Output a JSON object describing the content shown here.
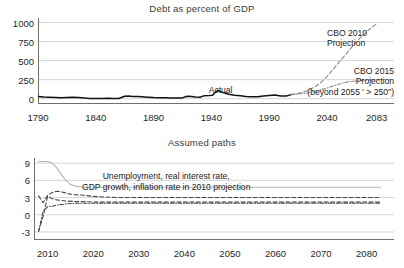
{
  "figure": {
    "background_color": "#ffffff",
    "axis_color": "#6f6f6f",
    "grid_color": "#c9c9c9",
    "actual_color": "#111111",
    "projection_color": "#8a8a8a",
    "unemployment_color": "#b5b5b5"
  },
  "chart_data": [
    {
      "type": "line",
      "title": "Debt as percent of GDP",
      "xlabel": "",
      "ylabel": "",
      "xlim": [
        1790,
        2098
      ],
      "ylim": [
        -70,
        1060
      ],
      "grid": true,
      "legend_position": "inline-annotations",
      "xticks": [
        1790,
        1840,
        1890,
        1940,
        1990,
        2040,
        2083
      ],
      "yticks": [
        0,
        250,
        500,
        750,
        1000
      ],
      "annotations": [
        {
          "name": "actual",
          "text": "Actual",
          "x": 1948,
          "y": 185
        },
        {
          "name": "cbo-2010",
          "text_lines": [
            "CBO 2010",
            "Projection"
          ],
          "x": 2040,
          "y": 930
        },
        {
          "name": "cbo-2015",
          "text_lines": [
            "CBO 2015",
            "Projection",
            "(beyond 2055 ' > 250\")"
          ],
          "x": 2072,
          "y": 430
        }
      ],
      "series": [
        {
          "name": "Actual",
          "style": "solid",
          "color": "#111111",
          "x": [
            1790,
            1795,
            1800,
            1805,
            1810,
            1815,
            1820,
            1825,
            1830,
            1835,
            1840,
            1845,
            1850,
            1855,
            1860,
            1865,
            1868,
            1872,
            1876,
            1880,
            1885,
            1890,
            1895,
            1900,
            1905,
            1910,
            1915,
            1918,
            1920,
            1923,
            1926,
            1930,
            1934,
            1938,
            1941,
            1944,
            1946,
            1950,
            1955,
            1960,
            1965,
            1970,
            1974,
            1980,
            1985,
            1990,
            1995,
            2000,
            2005,
            2009
          ],
          "y": [
            30,
            22,
            18,
            15,
            12,
            15,
            19,
            14,
            8,
            2,
            1,
            3,
            4,
            3,
            2,
            32,
            34,
            30,
            27,
            24,
            20,
            15,
            13,
            11,
            10,
            9,
            10,
            28,
            32,
            27,
            22,
            19,
            40,
            42,
            45,
            95,
            108,
            80,
            57,
            45,
            38,
            28,
            24,
            26,
            36,
            42,
            49,
            35,
            36,
            53
          ]
        },
        {
          "name": "CBO 2010 Projection",
          "style": "dashed",
          "color": "#8a8a8a",
          "x": [
            2009,
            2015,
            2020,
            2025,
            2030,
            2035,
            2040,
            2045,
            2050,
            2055,
            2060,
            2065,
            2070,
            2075,
            2080,
            2083
          ],
          "y": [
            53,
            70,
            90,
            120,
            160,
            215,
            290,
            380,
            470,
            560,
            650,
            740,
            820,
            890,
            950,
            985
          ]
        },
        {
          "name": "CBO 2015 Projection",
          "style": "dash-dot",
          "color": "#8a8a8a",
          "x": [
            2009,
            2015,
            2020,
            2025,
            2030,
            2035,
            2040,
            2045,
            2050,
            2055,
            2060,
            2070,
            2080,
            2090
          ],
          "y": [
            53,
            60,
            70,
            82,
            98,
            118,
            140,
            165,
            190,
            210,
            225,
            240,
            248,
            252
          ]
        }
      ]
    },
    {
      "type": "line",
      "title": "Assumed paths",
      "xlabel": "",
      "ylabel": "",
      "xlim": [
        2007,
        2086
      ],
      "ylim": [
        -4.4,
        9.9
      ],
      "grid": true,
      "legend_position": "inline-annotation",
      "xticks": [
        2010,
        2020,
        2030,
        2040,
        2050,
        2060,
        2070,
        2080
      ],
      "yticks": [
        -3,
        0,
        3,
        6,
        9
      ],
      "annotations": [
        {
          "name": "paths-label",
          "text_lines": [
            "Unemployment, real interest rate,",
            "GDP growth, inflation rate in 2010 projection"
          ],
          "x": 2036,
          "y": 7.6
        }
      ],
      "series": [
        {
          "name": "Unemployment",
          "style": "solid",
          "color": "#b5b5b5",
          "x": [
            2008,
            2009,
            2010,
            2011,
            2012,
            2013,
            2014,
            2015,
            2016,
            2018,
            2020,
            2030,
            2040,
            2060,
            2083
          ],
          "y": [
            9.3,
            9.3,
            9.3,
            9.0,
            8.2,
            7.0,
            6.0,
            5.3,
            5.0,
            4.8,
            4.8,
            4.8,
            4.8,
            4.8,
            4.8
          ]
        },
        {
          "name": "Real interest rate",
          "style": "dashed",
          "color": "#4a4a4a",
          "x": [
            2008,
            2009,
            2010,
            2011,
            2012,
            2013,
            2014,
            2015,
            2016,
            2018,
            2020,
            2025,
            2030,
            2040,
            2050,
            2060,
            2070,
            2083
          ],
          "y": [
            3.3,
            2.1,
            3.4,
            3.9,
            4.1,
            4.0,
            3.8,
            3.6,
            3.5,
            3.4,
            3.2,
            3.0,
            3.0,
            3.0,
            3.0,
            3.0,
            3.0,
            3.0
          ]
        },
        {
          "name": "GDP growth",
          "style": "dashed",
          "color": "#4a4a4a",
          "x": [
            2008,
            2009,
            2010,
            2011,
            2012,
            2014,
            2016,
            2018,
            2020,
            2030,
            2040,
            2060,
            2083
          ],
          "y": [
            -2.9,
            -0.3,
            3.2,
            2.8,
            2.6,
            2.4,
            2.3,
            2.3,
            2.2,
            2.2,
            2.2,
            2.2,
            2.2
          ]
        },
        {
          "name": "Inflation rate",
          "style": "dash-dot",
          "color": "#4a4a4a",
          "x": [
            2008,
            2009,
            2010,
            2011,
            2012,
            2013,
            2014,
            2016,
            2018,
            2020,
            2030,
            2040,
            2060,
            2083
          ],
          "y": [
            -2.9,
            0.6,
            1.4,
            1.5,
            1.7,
            1.8,
            1.9,
            2.0,
            2.0,
            2.0,
            2.0,
            2.0,
            2.0,
            2.0
          ]
        }
      ]
    }
  ],
  "panels": {
    "debt": {
      "title": "Debt as percent of GDP",
      "yticks": [
        "0",
        "250",
        "500",
        "750",
        "1000"
      ],
      "xticks": [
        "1790",
        "1840",
        "1890",
        "1940",
        "1990",
        "2040",
        "2083"
      ],
      "annotations": {
        "actual": "Actual",
        "cbo2010_line1": "CBO 2010",
        "cbo2010_line2": "Projection",
        "cbo2015_line1": "CBO 2015",
        "cbo2015_line2": "Projection",
        "cbo2015_line3": "(beyond 2055 ' > 250\")"
      }
    },
    "paths": {
      "title": "Assumed paths",
      "yticks": [
        "-3",
        "0",
        "3",
        "6",
        "9"
      ],
      "xticks": [
        "2010",
        "2020",
        "2030",
        "2040",
        "2050",
        "2060",
        "2070",
        "2080"
      ],
      "annotations": {
        "line1": "Unemployment, real interest rate,",
        "line2": "GDP growth, inflation rate in 2010 projection"
      }
    }
  }
}
